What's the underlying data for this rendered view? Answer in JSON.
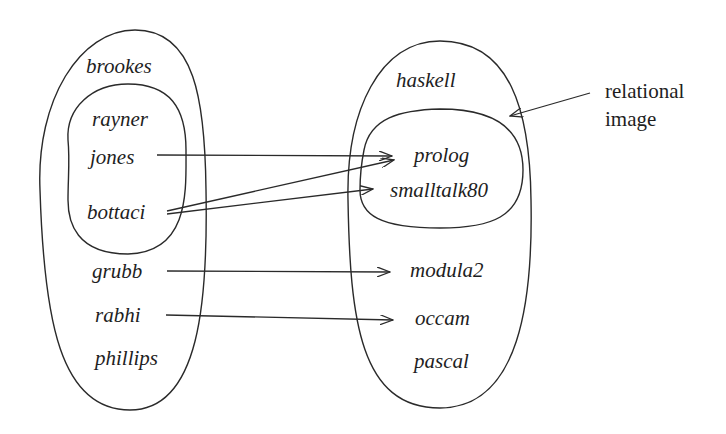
{
  "diagram": {
    "type": "relational-image set diagram",
    "colors": {
      "line": "#2a2a2a",
      "text": "#1e1e1e",
      "background": "#ffffff"
    },
    "domain_set": {
      "outer_elements": [
        "brookes",
        "grubb",
        "rabhi",
        "phillips"
      ],
      "inner_subset": [
        "rayner",
        "jones",
        "bottaci"
      ],
      "labels": {
        "brookes": "brookes",
        "rayner": "rayner",
        "jones": "jones",
        "bottaci": "bottaci",
        "grubb": "grubb",
        "rabhi": "rabhi",
        "phillips": "phillips"
      }
    },
    "range_set": {
      "outer_elements": [
        "haskell",
        "modula2",
        "occam",
        "pascal"
      ],
      "inner_subset": [
        "prolog",
        "smalltalk80"
      ],
      "labels": {
        "haskell": "haskell",
        "prolog": "prolog",
        "smalltalk80": "smalltalk80",
        "modula2": "modula2",
        "occam": "occam",
        "pascal": "pascal"
      }
    },
    "mappings": [
      {
        "from": "jones",
        "to": "prolog"
      },
      {
        "from": "bottaci",
        "to": "prolog"
      },
      {
        "from": "bottaci",
        "to": "smalltalk80"
      },
      {
        "from": "grubb",
        "to": "modula2"
      },
      {
        "from": "rabhi",
        "to": "occam"
      }
    ],
    "annotation": {
      "line1": "relational",
      "line2": "image",
      "points_to": "inner_subset of range_set"
    }
  }
}
